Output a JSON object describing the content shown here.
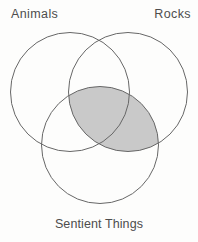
{
  "diagram": {
    "type": "venn-diagram",
    "title": "",
    "labels": {
      "top_left_circle": "Animals",
      "top_right_circle": "Rocks",
      "bottom_circle": "Sentient Things"
    },
    "sets": [
      {
        "name": "Animals",
        "position": "top-left",
        "shaded_alone": false
      },
      {
        "name": "Rocks",
        "position": "top-right",
        "shaded_alone": false
      },
      {
        "name": "Sentient Things",
        "position": "bottom-center",
        "shaded_alone": false
      }
    ],
    "shaded_region": "intersection of Rocks and Sentient Things (entire lens, including the part also inside Animals)",
    "unshaded_regions": [
      "Animals only",
      "Rocks only",
      "Sentient Things only",
      "Animals ∩ Rocks only",
      "Animals ∩ Sentient Things only"
    ],
    "colors": {
      "background": "#fdfdfc",
      "circle_stroke": "#676767",
      "shade_fill": "#c9c9c9",
      "label_text": "#4d4d4d"
    }
  }
}
